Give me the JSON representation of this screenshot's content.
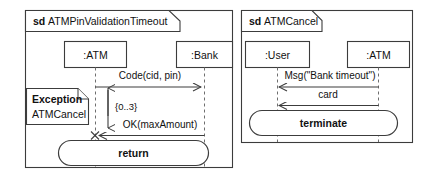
{
  "diagram": {
    "type": "uml-sequence-diagram",
    "background_color": "#ffffff",
    "line_color": "#3c3c3c",
    "lifeline_color": "#6e6e6e"
  },
  "frames": [
    {
      "id": "frame-left",
      "keyword": "sd",
      "name": "ATMPinValidationTimeout",
      "lifelines": [
        {
          "id": "atm",
          "label": ":ATM"
        },
        {
          "id": "bank",
          "label": ":Bank"
        }
      ],
      "messages": [
        {
          "id": "code",
          "label": "Code(cid, pin)",
          "from": "atm",
          "to": "bank",
          "direction": "right"
        },
        {
          "id": "ok",
          "label": "OK(maxAmount)",
          "from": "bank",
          "to": "atm",
          "direction": "left"
        }
      ],
      "constraint": "{0..3}",
      "note": {
        "title": "Exception",
        "body": "ATMCancel"
      },
      "action": "return"
    },
    {
      "id": "frame-right",
      "keyword": "sd",
      "name": "ATMCancel",
      "lifelines": [
        {
          "id": "user",
          "label": ":User"
        },
        {
          "id": "atm2",
          "label": ":ATM"
        }
      ],
      "messages": [
        {
          "id": "msg",
          "label": "Msg(\"Bank timeout\")",
          "from": "atm2",
          "to": "user",
          "direction": "left"
        },
        {
          "id": "card",
          "label": "card",
          "from": "atm2",
          "to": "user",
          "direction": "left"
        }
      ],
      "action": "terminate"
    }
  ]
}
